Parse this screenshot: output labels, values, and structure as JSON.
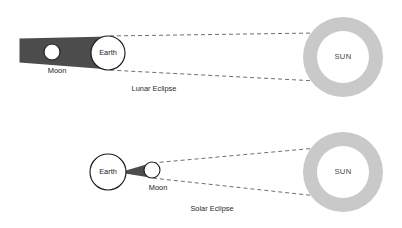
{
  "figure": {
    "background_color": "#ffffff"
  },
  "colors": {
    "umbra": "#4c4c4c",
    "sun_ring": "#c9c9c9",
    "sun_core": "#ffffff",
    "outline": "#1c1c1c",
    "ray": "#555555",
    "text": "#1a1a1a"
  },
  "panels": [
    {
      "id": "lunar",
      "caption": "Lunar Eclipse",
      "bodies": {
        "earth": {
          "label": "Earth",
          "cx": 108,
          "cy": 53,
          "r": 17
        },
        "moon": {
          "label": "Moon",
          "cx": 52,
          "cy": 52,
          "r": 8,
          "label_x": 57,
          "label_y": 71
        },
        "sun": {
          "label": "SUN",
          "cx": 343,
          "cy": 57,
          "r_outer": 40,
          "r_inner": 26
        }
      },
      "caption_x": 154,
      "caption_y": 89
    },
    {
      "id": "solar",
      "caption": "Solar Eclipse",
      "bodies": {
        "earth": {
          "label": "Earth",
          "cx": 108,
          "cy": 172,
          "r": 18
        },
        "moon": {
          "label": "Moon",
          "cx": 152,
          "cy": 170,
          "r": 8,
          "label_x": 158,
          "label_y": 188
        },
        "sun": {
          "label": "SUN",
          "cx": 343,
          "cy": 172,
          "r_outer": 40,
          "r_inner": 26
        }
      },
      "caption_x": 212,
      "caption_y": 209
    }
  ]
}
